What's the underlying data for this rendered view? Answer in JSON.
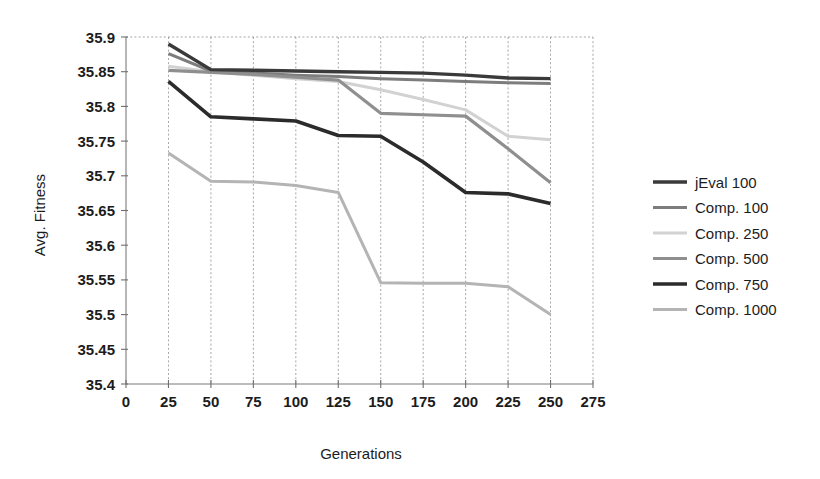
{
  "chart_data": {
    "type": "line",
    "title": "",
    "xlabel": "Generations",
    "ylabel": "Avg. Fitness",
    "xlim": [
      0,
      275
    ],
    "ylim": [
      35.4,
      35.9
    ],
    "xticks": [
      0,
      25,
      50,
      75,
      100,
      125,
      150,
      175,
      200,
      225,
      250,
      275
    ],
    "yticks": [
      35.4,
      35.45,
      35.5,
      35.55,
      35.6,
      35.65,
      35.7,
      35.75,
      35.8,
      35.85,
      35.9
    ],
    "xtick_labels": [
      "0",
      "25",
      "50",
      "75",
      "100",
      "125",
      "150",
      "175",
      "200",
      "225",
      "250",
      "275"
    ],
    "ytick_labels": [
      "35.4",
      "35.45",
      "35.5",
      "35.55",
      "35.6",
      "35.65",
      "35.7",
      "35.75",
      "35.8",
      "35.85",
      "35.9"
    ],
    "grid": "vertical",
    "legend_position": "right",
    "x": [
      25,
      50,
      75,
      100,
      125,
      150,
      175,
      200,
      225,
      250
    ],
    "series": [
      {
        "name": "jEval 100",
        "color": "#3a3a3a",
        "width": 3.4,
        "values": [
          35.89,
          35.853,
          35.852,
          35.851,
          35.85,
          35.849,
          35.848,
          35.845,
          35.841,
          35.84
        ]
      },
      {
        "name": "Comp. 100",
        "color": "#7d7d7d",
        "width": 3.0,
        "values": [
          35.876,
          35.851,
          35.848,
          35.845,
          35.843,
          35.84,
          35.838,
          35.836,
          35.834,
          35.833
        ]
      },
      {
        "name": "Comp. 250",
        "color": "#d2d2d2",
        "width": 3.0,
        "values": [
          35.858,
          35.85,
          35.845,
          35.84,
          35.836,
          35.824,
          35.81,
          35.795,
          35.757,
          35.752
        ]
      },
      {
        "name": "Comp. 500",
        "color": "#8f8f8f",
        "width": 3.2,
        "values": [
          35.852,
          35.849,
          35.846,
          35.842,
          35.838,
          35.79,
          35.788,
          35.786,
          35.739,
          35.69
        ]
      },
      {
        "name": "Comp. 750",
        "color": "#2b2b2b",
        "width": 3.6,
        "values": [
          35.836,
          35.785,
          35.782,
          35.779,
          35.758,
          35.757,
          35.72,
          35.676,
          35.674,
          35.66
        ]
      },
      {
        "name": "Comp. 1000",
        "color": "#b4b4b4",
        "width": 3.0,
        "values": [
          35.733,
          35.692,
          35.691,
          35.686,
          35.676,
          35.546,
          35.545,
          35.545,
          35.54,
          35.5
        ]
      }
    ]
  },
  "legend": {
    "entries": [
      {
        "label": "jEval 100"
      },
      {
        "label": "Comp. 100"
      },
      {
        "label": "Comp. 250"
      },
      {
        "label": "Comp. 500"
      },
      {
        "label": "Comp. 750"
      },
      {
        "label": "Comp. 1000"
      }
    ]
  },
  "axes": {
    "x_title": "Generations",
    "y_title": "Avg. Fitness"
  }
}
